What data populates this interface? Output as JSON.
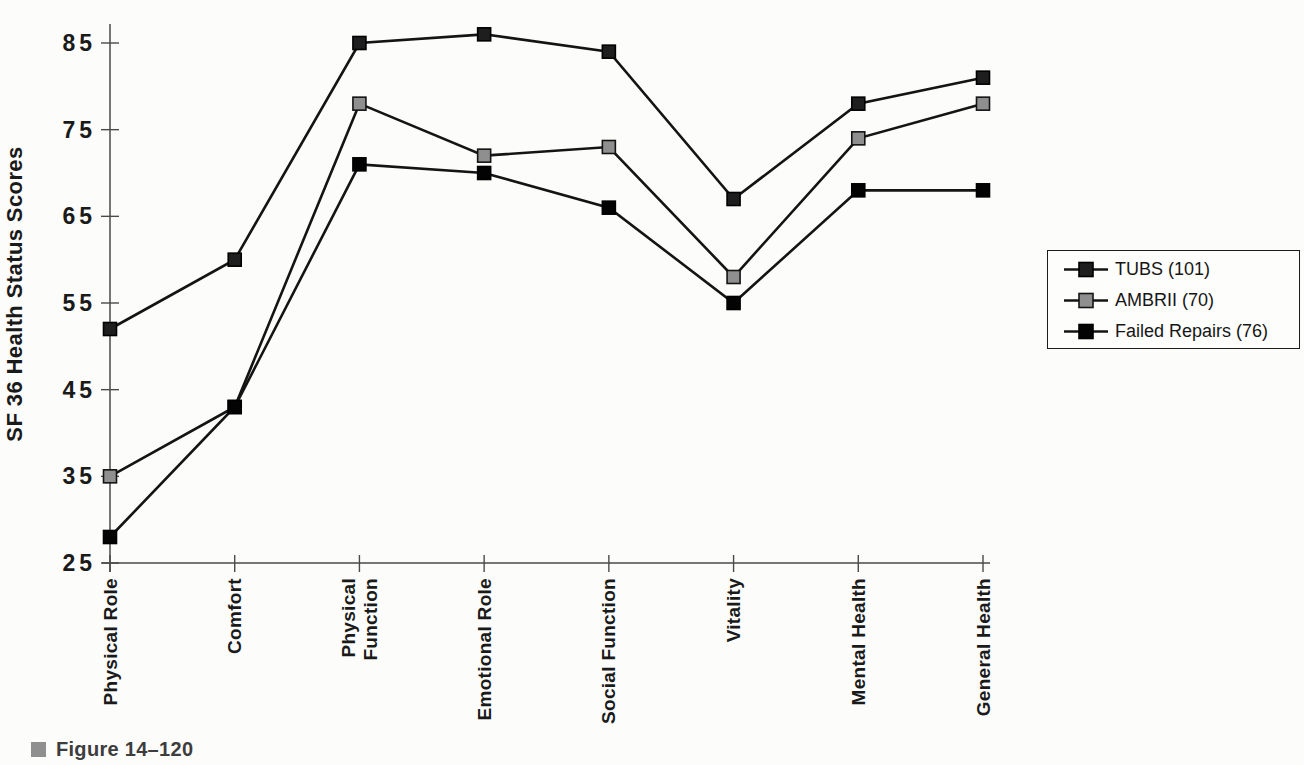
{
  "page": {
    "background": "#fcfcfb",
    "axis_color": "#4a4a4a",
    "text_color": "#1a1a1a"
  },
  "figure_caption": {
    "bullet": "square-bullet",
    "bullet_color": "#8f8f8f",
    "text": "Figure 14–120"
  },
  "chart_data": {
    "type": "line",
    "title": "",
    "xlabel": "",
    "ylabel": "SF 36 Health Status Scores",
    "ylim": [
      25,
      87
    ],
    "yticks": [
      25,
      35,
      45,
      55,
      65,
      75,
      85
    ],
    "grid": false,
    "legend": {
      "position": "right-outside",
      "border": true
    },
    "categories": [
      "Physical Role",
      "Comfort",
      "Physical\nFunction",
      "Emotional Role",
      "Social Function",
      "Vitality",
      "Mental Health",
      "General Health"
    ],
    "series": [
      {
        "name": "TUBS (101)",
        "values": [
          52,
          60,
          85,
          86,
          84,
          67,
          78,
          81
        ],
        "line_color": "#141414",
        "marker": "square",
        "marker_fill": "#1e1e1e",
        "marker_stroke": "#000000"
      },
      {
        "name": "AMBRII (70)",
        "values": [
          35,
          43,
          78,
          72,
          73,
          58,
          74,
          78
        ],
        "line_color": "#141414",
        "marker": "square",
        "marker_fill": "#8f8f8f",
        "marker_stroke": "#141414"
      },
      {
        "name": "Failed Repairs (76)",
        "values": [
          28,
          43,
          71,
          70,
          66,
          55,
          68,
          68
        ],
        "line_color": "#141414",
        "marker": "square",
        "marker_fill": "#030303",
        "marker_stroke": "#000000"
      }
    ]
  }
}
